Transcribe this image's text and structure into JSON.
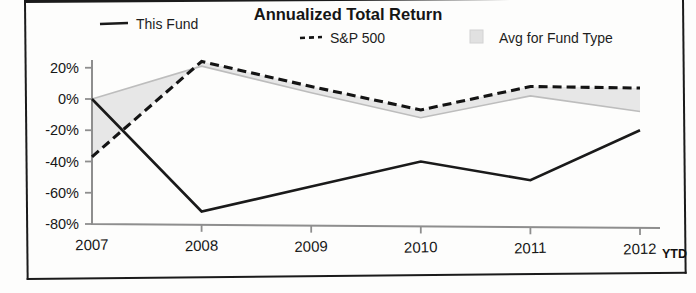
{
  "chart_data": {
    "type": "line",
    "title": "Annualized Total Return",
    "xlabel": "",
    "ylabel": "",
    "categories": [
      "2007",
      "2008",
      "2009",
      "2010",
      "2011",
      "2012"
    ],
    "x_tick_labels": [
      "2007",
      "2008",
      "2009",
      "2010",
      "2011",
      "2012"
    ],
    "x_suffix_label": "YTD",
    "y_tick_labels": [
      "20%",
      "0%",
      "-20%",
      "-40%",
      "-60%",
      "-80%"
    ],
    "y_tick_values": [
      20,
      0,
      -20,
      -40,
      -60,
      -80
    ],
    "ylim": [
      -80,
      28
    ],
    "grid": false,
    "legend_position": "top",
    "series": [
      {
        "name": "This Fund",
        "style": "solid",
        "color": "#1a1a1a",
        "values": [
          0,
          -72,
          -56,
          -40,
          -52,
          -20
        ]
      },
      {
        "name": "S&P 500",
        "style": "dashed",
        "color": "#141414",
        "values": [
          -37,
          24,
          8,
          -7,
          8,
          7
        ]
      },
      {
        "name": "Avg for Fund Type",
        "style": "shaded-band",
        "color": "#e3e3e3",
        "values": [
          0,
          21,
          4,
          -12,
          2,
          -8
        ]
      }
    ]
  },
  "legend": {
    "items": [
      {
        "label": "This Fund",
        "marker": "solid-line-marker"
      },
      {
        "label": "S&P 500",
        "marker": "dashed-line-marker"
      },
      {
        "label": "Avg for Fund Type",
        "marker": "gray-square-swatch"
      }
    ]
  }
}
